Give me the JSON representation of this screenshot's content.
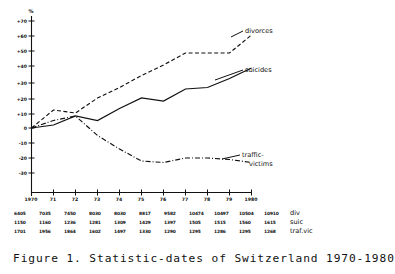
{
  "figure": {
    "caption": "Figure 1.  Statistic-dates of Switzerland 1970-1980"
  },
  "chart_data": {
    "type": "line",
    "title": "",
    "xlabel": "",
    "ylabel": "%",
    "y_unit_symbol": "%",
    "grid": false,
    "legend_position": "inline-right",
    "xlim": [
      1970,
      1980
    ],
    "ylim": [
      -30,
      70
    ],
    "ytick_step": 10,
    "x": [
      1970,
      1971,
      1972,
      1973,
      1974,
      1975,
      1976,
      1977,
      1978,
      1979,
      1980
    ],
    "xtick_labels": [
      "1970",
      "71",
      "72",
      "73",
      "74",
      "75",
      "76",
      "77",
      "78",
      "79",
      "1980"
    ],
    "ytick_labels": [
      "+70",
      "+60",
      "+50",
      "+40",
      "+30",
      "+20",
      "+10",
      "0",
      "-10",
      "-20",
      "-30"
    ],
    "ytick_values": [
      70,
      60,
      50,
      40,
      30,
      20,
      10,
      0,
      -10,
      -20,
      -30
    ],
    "series": [
      {
        "name": "divorces",
        "label": "divorces",
        "style": "dashed",
        "values": [
          0,
          12,
          10,
          20,
          27,
          35,
          42,
          50,
          50,
          50,
          62
        ]
      },
      {
        "name": "suicides",
        "label": "suicides",
        "style": "solid",
        "values": [
          0,
          2,
          8,
          5,
          13,
          20,
          18,
          26,
          27,
          33,
          40
        ]
      },
      {
        "name": "traffic-victims",
        "label": "traffic-",
        "label_line2": "victims",
        "style": "dash-dot",
        "values": [
          0,
          5,
          8,
          -5,
          -14,
          -22,
          -23,
          -20,
          -20,
          -21,
          -23
        ]
      }
    ]
  },
  "table": {
    "rows": [
      {
        "label": "div",
        "values": [
          "6405",
          "7035",
          "7450",
          "8030",
          "8030",
          "8817",
          "9582",
          "10474",
          "10497",
          "10504",
          "10910"
        ]
      },
      {
        "label": "suic",
        "values": [
          "1150",
          "1160",
          "1236",
          "1281",
          "1309",
          "1429",
          "1397",
          "1505",
          "1515",
          "1560",
          "1615"
        ]
      },
      {
        "label": "traf.vic",
        "values": [
          "1701",
          "1956",
          "1864",
          "1602",
          "1497",
          "1330",
          "1290",
          "1295",
          "1286",
          "1295",
          "1268"
        ]
      }
    ]
  }
}
